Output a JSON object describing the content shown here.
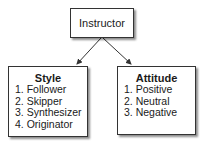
{
  "root": {
    "label": "Instructor"
  },
  "children": [
    {
      "title": "Style",
      "items": [
        "1. Follower",
        "2. Skipper",
        "3. Synthesizer",
        "4. Originator"
      ]
    },
    {
      "title": "Attitude",
      "items": [
        "1. Positive",
        "2. Neutral",
        "3. Negative"
      ]
    }
  ],
  "colors": {
    "border": "#333333",
    "arrow": "#333333",
    "background": "#ffffff"
  }
}
